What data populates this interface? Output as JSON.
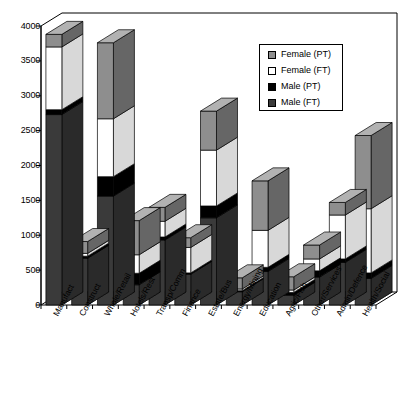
{
  "chart_data": {
    "type": "bar",
    "subtype": "stacked-3d-column",
    "title": "",
    "xlabel": "",
    "ylabel": "",
    "ylim": [
      0,
      4000
    ],
    "yticks": [
      0,
      500,
      1000,
      1500,
      2000,
      2500,
      3000,
      3500,
      4000
    ],
    "ytick_labels": [
      "0",
      "500",
      "1000",
      "1500",
      "2000",
      "2500",
      "3000",
      "3500",
      "4000"
    ],
    "grid": false,
    "legend_position": "top-right",
    "stack_order_bottom_to_top": [
      "Male (FT)",
      "Male (PT)",
      "Female (FT)",
      "Female (PT)"
    ],
    "categories": [
      "Manufact",
      "Construct",
      "Whole/Retail",
      "Hotels/Rest",
      "Transp/Comm",
      "Finance",
      "Estate/Bus",
      "Energy/Mining",
      "Education",
      "Agric/Fish",
      "Other/Services",
      "Admin/Defence",
      "Health/Social"
    ],
    "series": [
      {
        "name": "Male (FT)",
        "color": "#3a3a3a",
        "values": [
          2730,
          670,
          1560,
          290,
          930,
          440,
          1250,
          190,
          480,
          140,
          400,
          610,
          380
        ]
      },
      {
        "name": "Male (PT)",
        "color": "#000000",
        "values": [
          70,
          30,
          280,
          165,
          45,
          20,
          170,
          15,
          60,
          40,
          90,
          50,
          80
        ]
      },
      {
        "name": "Female (FT)",
        "color": "#ffffff",
        "values": [
          900,
          40,
          830,
          265,
          225,
          365,
          800,
          25,
          530,
          35,
          170,
          630,
          920
        ]
      },
      {
        "name": "Female (PT)",
        "color": "#8e8e8e",
        "values": [
          180,
          170,
          1090,
          490,
          200,
          140,
          560,
          160,
          710,
          190,
          200,
          180,
          1050
        ]
      }
    ],
    "totals": [
      3880,
      910,
      3760,
      1210,
      1400,
      965,
      2780,
      390,
      1780,
      405,
      860,
      1470,
      2430
    ]
  },
  "legend": {
    "items": [
      {
        "label": "Female (PT)",
        "swatch": "#8e8e8e"
      },
      {
        "label": "Female (FT)",
        "swatch": "#ffffff"
      },
      {
        "label": "Male (PT)",
        "swatch": "#000000"
      },
      {
        "label": "Male (FT)",
        "swatch": "#3a3a3a"
      }
    ]
  },
  "axis": {
    "y_max_label": "4000",
    "y_min_label": "0"
  }
}
